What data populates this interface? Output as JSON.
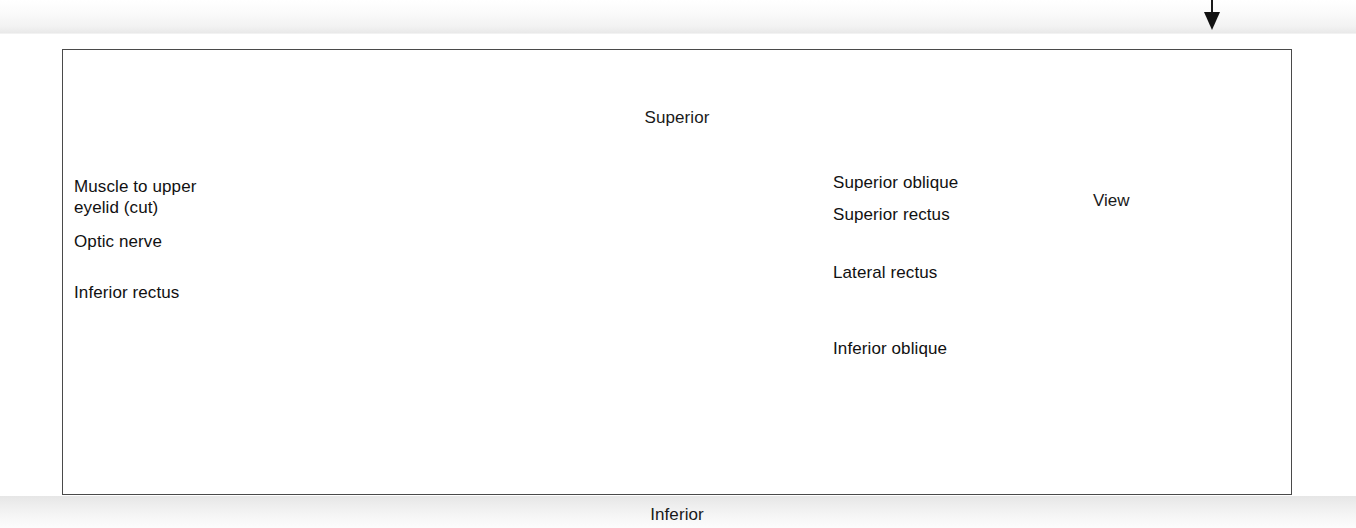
{
  "figure": {
    "title_region": "orbital-muscles-lateral-view",
    "orientation": {
      "top_label": "Superior",
      "bottom_label": "Inferior"
    },
    "labels_left": [
      {
        "id": "muscle-to-upper-eyelid",
        "line1": "Muscle to upper",
        "line2": "eyelid (cut)"
      },
      {
        "id": "optic-nerve",
        "line1": "Optic nerve",
        "line2": ""
      },
      {
        "id": "inferior-rectus",
        "line1": "Inferior rectus",
        "line2": ""
      }
    ],
    "labels_right": [
      {
        "id": "superior-oblique",
        "text": "Superior oblique"
      },
      {
        "id": "superior-rectus",
        "text": "Superior rectus"
      },
      {
        "id": "lateral-rectus",
        "text": "Lateral rectus"
      },
      {
        "id": "inferior-oblique",
        "text": "Inferior oblique"
      }
    ],
    "view_indicator": {
      "label": "View",
      "icon": "curved-arrow-right-icon",
      "reference_image": "anterior-skull-photograph",
      "section_plane": "vertical-sagittal-line-over-right-orbit"
    },
    "page_marker": {
      "icon": "down-arrow-icon"
    },
    "colors": {
      "frame_border": "#4a4a4a",
      "text": "#111111",
      "leader_line": "#111111",
      "arrow_gray": "#b0b0b0",
      "page_band": "#e9e9e9"
    }
  }
}
